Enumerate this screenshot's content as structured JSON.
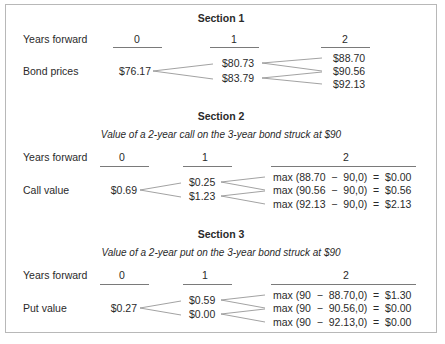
{
  "sections": [
    {
      "title": "Section 1",
      "subtitle": "",
      "years_label": "Years forward",
      "year_headers": [
        "0",
        "1",
        "2"
      ],
      "row_label": "Bond prices",
      "tree": {
        "t0": "$76.17",
        "t1": [
          "$80.73",
          "$83.79"
        ],
        "t2": [
          "$88.70",
          "$90.56",
          "$92.13"
        ]
      }
    },
    {
      "title": "Section 2",
      "subtitle": "Value of a 2-year call on the 3-year bond struck at $90",
      "years_label": "Years forward",
      "year_headers": [
        "0",
        "1",
        "2"
      ],
      "row_label": "Call value",
      "tree": {
        "t0": "$0.69",
        "t1": [
          "$0.25",
          "$1.23"
        ],
        "t2": [
          "max (88.70  −  90,0)  =  $0.00",
          "max (90.56  −  90,0)  =  $0.56",
          "max (92.13  −  90,0)  =  $2.13"
        ]
      }
    },
    {
      "title": "Section 3",
      "subtitle": "Value of a 2-year put on the 3-year bond struck at $90",
      "years_label": "Years forward",
      "year_headers": [
        "0",
        "1",
        "2"
      ],
      "row_label": "Put value",
      "tree": {
        "t0": "$0.27",
        "t1": [
          "$0.59",
          "$0.00"
        ],
        "t2": [
          "max (90  −  88.70,0)  =  $1.30",
          "max (90  −  90.56,0)  =  $0.00",
          "max (90  −  92.13,0)  =  $0.00"
        ]
      }
    }
  ]
}
